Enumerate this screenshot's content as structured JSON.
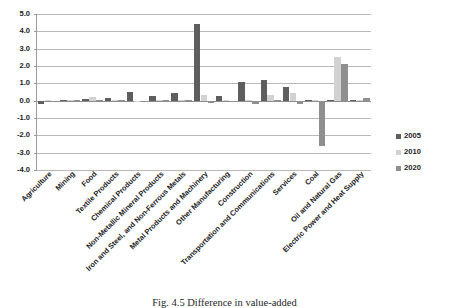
{
  "chart_data": {
    "type": "bar",
    "title": "",
    "xlabel": "",
    "ylabel": "",
    "ylim": [
      -4.0,
      5.0
    ],
    "ytick_step": 1.0,
    "ytick_labels": [
      "5.0",
      "4.0",
      "3.0",
      "2.0",
      "1.0",
      "0.0",
      "-1.0",
      "-2.0",
      "-3.0",
      "-4.0"
    ],
    "grid": true,
    "legend_position": "right",
    "categories": [
      "Agriculture",
      "Mining",
      "Food",
      "Textile Products",
      "Chemical Products",
      "Non-Metallic Mineral Products",
      "Iron and Steel, and Non-Ferrous Metals",
      "Metal Products and Machinery",
      "Other Manufacturing",
      "Construction",
      "Transportation and Communications",
      "Services",
      "Coal",
      "Oil and Natural Gas",
      "Electric Power and Heat Supply"
    ],
    "series": [
      {
        "name": "2005",
        "color": "#5e5e5e",
        "values": [
          -0.22,
          0.05,
          0.08,
          0.18,
          0.5,
          0.26,
          0.46,
          4.4,
          0.28,
          1.05,
          1.2,
          0.76,
          0.03,
          0.05,
          0.06
        ]
      },
      {
        "name": "2010",
        "color": "#d2d2d2",
        "values": [
          0.02,
          0.02,
          0.22,
          0.03,
          -0.06,
          0.02,
          0.03,
          0.32,
          0.03,
          0.04,
          0.3,
          0.42,
          0.02,
          2.52,
          0.04
        ]
      },
      {
        "name": "2020",
        "color": "#8f8f8f",
        "values": [
          -0.05,
          0.02,
          0.04,
          0.02,
          -0.08,
          0.02,
          0.03,
          -0.12,
          -0.04,
          -0.18,
          0.04,
          -0.2,
          -2.6,
          2.1,
          0.14
        ]
      }
    ]
  },
  "legend": {
    "items": [
      {
        "label": "2005",
        "color": "#5e5e5e"
      },
      {
        "label": "2010",
        "color": "#d2d2d2"
      },
      {
        "label": "2020",
        "color": "#8f8f8f"
      }
    ]
  },
  "caption": {
    "text": "Fig. 4.5   Difference in value-added"
  }
}
